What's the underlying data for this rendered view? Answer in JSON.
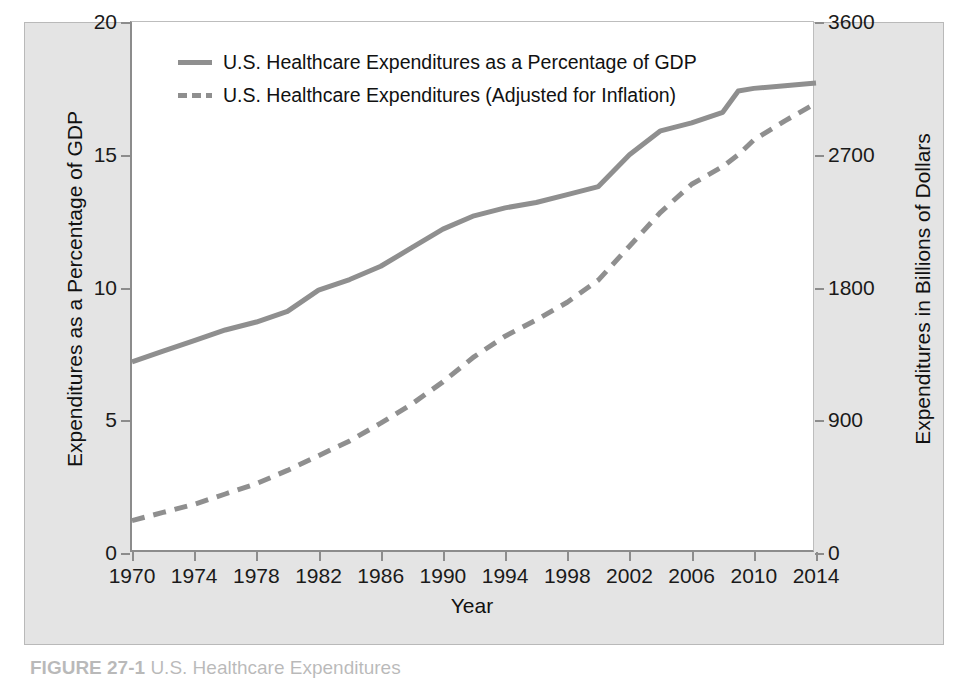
{
  "figure": {
    "caption_label": "FIGURE 27-1",
    "caption_text": "U.S. Healthcare Expenditures",
    "panel_bg": "#e4e4e4",
    "plot_bg": "#ffffff",
    "line_color": "#8f8f8f",
    "axis_color": "#8c8c8c"
  },
  "legend": {
    "position": "top-left-inside",
    "entries": [
      {
        "style": "solid",
        "label": "U.S. Healthcare Expenditures as a Percentage of GDP"
      },
      {
        "style": "dashed",
        "label": "U.S. Healthcare Expenditures (Adjusted for Inflation)"
      }
    ]
  },
  "chart_data": {
    "type": "line",
    "title": "",
    "xlabel": "Year",
    "ylabel": "Expenditures as a Percentage of GDP",
    "y2label": "Expenditures in Billions of Dollars",
    "grid": false,
    "xlim": [
      1970,
      2014
    ],
    "ylim": [
      0,
      20
    ],
    "y2lim": [
      0,
      3600
    ],
    "xticks": [
      1970,
      1974,
      1978,
      1982,
      1986,
      1990,
      1994,
      1998,
      2002,
      2006,
      2010,
      2014
    ],
    "yticks": [
      0,
      5,
      10,
      15,
      20
    ],
    "y2ticks": [
      0,
      900,
      1800,
      2700,
      3600
    ],
    "x": [
      1970,
      1972,
      1974,
      1976,
      1978,
      1980,
      1982,
      1984,
      1986,
      1988,
      1990,
      1992,
      1994,
      1996,
      1998,
      2000,
      2002,
      2004,
      2006,
      2008,
      2009,
      2010,
      2012,
      2014
    ],
    "series": [
      {
        "name": "U.S. Healthcare Expenditures as a Percentage of GDP",
        "axis": "left",
        "style": "solid",
        "color": "#8f8f8f",
        "units": "percent of GDP",
        "values": [
          7.2,
          7.6,
          8.0,
          8.4,
          8.7,
          9.1,
          9.9,
          10.3,
          10.8,
          11.5,
          12.2,
          12.7,
          13.0,
          13.2,
          13.5,
          13.8,
          15.0,
          15.9,
          16.2,
          16.6,
          17.4,
          17.5,
          17.6,
          17.7
        ]
      },
      {
        "name": "U.S. Healthcare Expenditures (Adjusted for Inflation)",
        "axis": "right",
        "style": "dashed",
        "color": "#8f8f8f",
        "units": "billions of dollars",
        "values": [
          220,
          275,
          330,
          400,
          470,
          560,
          660,
          760,
          880,
          1010,
          1160,
          1330,
          1470,
          1580,
          1700,
          1850,
          2080,
          2310,
          2500,
          2620,
          2700,
          2800,
          2930,
          3050
        ]
      }
    ]
  }
}
